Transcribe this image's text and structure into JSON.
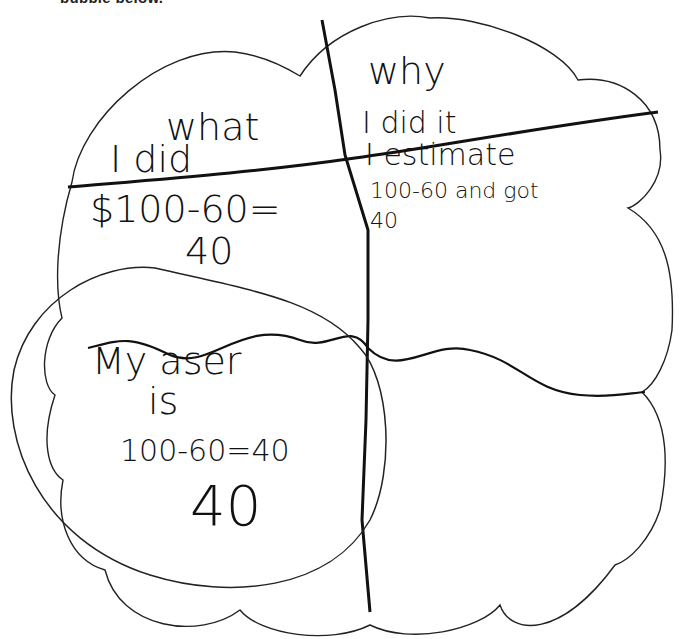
{
  "header": {
    "instruction_fragment": "bubble below."
  },
  "worksheet": {
    "quadrant_top_left": {
      "heading_line1": "what",
      "heading_line2": "I did",
      "work_line1": "$100-60=",
      "work_line2": "40"
    },
    "quadrant_top_right": {
      "heading_line1": "why",
      "heading_line2": "I did it",
      "work_line1": "I estimate",
      "work_line2": "100-60 and got",
      "work_line3": "40"
    },
    "quadrant_bottom_left": {
      "answer_line1": "My aser",
      "answer_line2": "is",
      "answer_line3": "100-60=40",
      "answer_line4": "40"
    },
    "quadrant_bottom_right": {}
  },
  "colors": {
    "ink": "#111111",
    "outline": "#222222",
    "paper": "#ffffff"
  }
}
